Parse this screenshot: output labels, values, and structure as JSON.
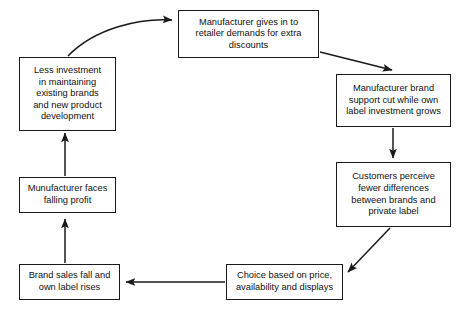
{
  "diagram": {
    "background_color": "#ffffff",
    "line_color": "#1a1a1a",
    "text_color": "#111111",
    "nodes": [
      {
        "id": "giving-in",
        "label": "Manufacturer gives in to\nretailer demands for extra\ndiscounts"
      },
      {
        "id": "less-investment",
        "label": "Less investment\nin maintaining\nexisting brands\nand new product\ndevelopment"
      },
      {
        "id": "brand-support",
        "label": "Manufacturer brand\nsupport cut while own\nlabel investment grows"
      },
      {
        "id": "customers",
        "label": "Customers perceive\nfewer differences\nbetween brands and\nprivate label"
      },
      {
        "id": "falling-profit",
        "label": "Munufacturer faces\nfalling profit"
      },
      {
        "id": "brand-sales",
        "label": "Brand sales fall and\nown label rises"
      },
      {
        "id": "choice",
        "label": "Choice based on price,\navailability and displays"
      }
    ],
    "edges": [
      {
        "id": "less-investment-to-giving-in",
        "from": "less-investment",
        "to": "giving-in",
        "style": "curved"
      },
      {
        "id": "giving-in-to-brand-support",
        "from": "giving-in",
        "to": "brand-support",
        "style": "diagonal"
      },
      {
        "id": "brand-support-to-customers",
        "from": "brand-support",
        "to": "customers",
        "style": "vertical"
      },
      {
        "id": "customers-to-choice",
        "from": "customers",
        "to": "choice",
        "style": "diagonal"
      },
      {
        "id": "choice-to-brand-sales",
        "from": "choice",
        "to": "brand-sales",
        "style": "horizontal"
      },
      {
        "id": "brand-sales-to-falling-profit",
        "from": "brand-sales",
        "to": "falling-profit",
        "style": "vertical"
      },
      {
        "id": "falling-profit-to-less-investment",
        "from": "falling-profit",
        "to": "less-investment",
        "style": "vertical"
      }
    ]
  }
}
